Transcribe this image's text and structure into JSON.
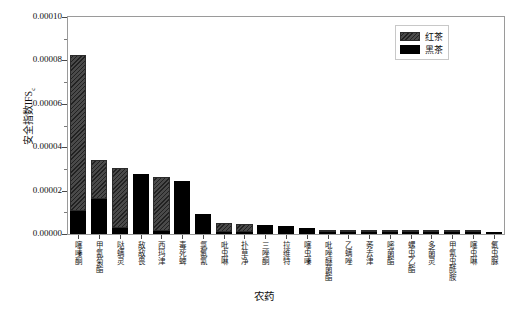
{
  "figure": {
    "top_strip_text": "",
    "caption": ""
  },
  "legend": {
    "position": "top-right",
    "items": [
      {
        "label": "红茶",
        "key": "red_tea",
        "style": "hatched-dark-gray",
        "color": "#4a4a4a"
      },
      {
        "label": "黑茶",
        "key": "dark_tea",
        "style": "solid-black",
        "color": "#000000"
      }
    ]
  },
  "axes": {
    "ylabel": "安全指数IFS",
    "ylabel_sub": "c",
    "xlabel": "农药",
    "yticks": [
      "0.00000",
      "0.00002",
      "0.00004",
      "0.00006",
      "0.00008",
      "0.00010"
    ],
    "ytick_values": [
      0,
      2e-05,
      4e-05,
      6e-05,
      8e-05,
      0.0001
    ],
    "ylim": [
      0,
      0.0001
    ],
    "grid": "off"
  },
  "chart_data": {
    "type": "bar",
    "subtype": "stacked-vertical",
    "title": "",
    "xlabel": "农药",
    "ylabel": "安全指数IFS",
    "ylim": [
      0,
      0.0001
    ],
    "grid": false,
    "legend_position": "upper right",
    "categories": [
      "噻嗪酮",
      "甲氰菊酯",
      "哒螨灵",
      "敌敌畏",
      "西玛津",
      "毒死蜱",
      "氯氟氰",
      "吡虫啉",
      "扑草净",
      "三唑酮",
      "拉维特",
      "噻虫嗪",
      "吡唑醚菌酯",
      "乙螨唑",
      "莠去津",
      "嘧菌酯",
      "螺虫乙酯",
      "多菌灵",
      "甲氰虫酰胺",
      "噻虫啉",
      "氟虫脲"
    ],
    "series": [
      {
        "name": "黑茶",
        "color": "#000000",
        "values": [
          1.05e-05,
          1.62e-05,
          3e-06,
          2.77e-05,
          1.5e-06,
          2.45e-05,
          9.2e-06,
          8e-07,
          8e-07,
          4.2e-06,
          3.8e-06,
          3e-06,
          8e-07,
          1.1e-06,
          1e-06,
          8e-07,
          6e-07,
          5e-07,
          4e-07,
          3e-07,
          2e-07
        ]
      },
      {
        "name": "红茶",
        "color": "#4a4a4a",
        "values": [
          7.18e-05,
          1.78e-05,
          2.75e-05,
          0.0,
          2.48e-05,
          0.0,
          0.0,
          4e-06,
          3.9e-06,
          0.0,
          0.0,
          0.0,
          1e-06,
          3e-07,
          2e-07,
          3e-07,
          3e-07,
          2e-07,
          2e-07,
          2e-07,
          1e-07
        ]
      }
    ],
    "totals": [
      8.23e-05,
      3.4e-05,
      3.05e-05,
      2.77e-05,
      2.63e-05,
      2.45e-05,
      9.2e-06,
      4.8e-06,
      4.7e-06,
      4.2e-06,
      3.8e-06,
      3e-06,
      1.8e-06,
      1.4e-06,
      1.2e-06,
      1.1e-06,
      9e-07,
      7e-07,
      6e-07,
      5e-07,
      3e-07
    ]
  }
}
